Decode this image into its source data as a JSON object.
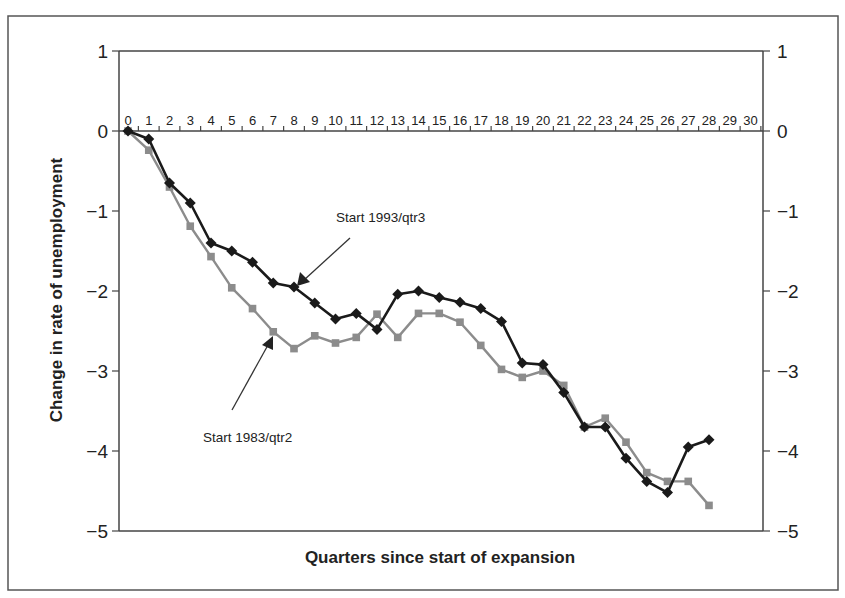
{
  "chart_data": {
    "type": "line",
    "title": "",
    "xlabel": "Quarters since start of expansion",
    "ylabel": "Change in rate of unemployment",
    "xlim": [
      0,
      30
    ],
    "ylim": [
      -5,
      1
    ],
    "x_ticks": [
      0,
      1,
      2,
      3,
      4,
      5,
      6,
      7,
      8,
      9,
      10,
      11,
      12,
      13,
      14,
      15,
      16,
      17,
      18,
      19,
      20,
      21,
      22,
      23,
      24,
      25,
      26,
      27,
      28,
      29,
      30
    ],
    "y_ticks": [
      1,
      0,
      -1,
      -2,
      -3,
      -4,
      -5
    ],
    "y_tick_labels": [
      "1",
      "0",
      "−1",
      "−2",
      "−3",
      "−4",
      "−5"
    ],
    "grid": false,
    "legend": "none (series identified by annotations)",
    "x": [
      0,
      1,
      2,
      3,
      4,
      5,
      6,
      7,
      8,
      9,
      10,
      11,
      12,
      13,
      14,
      15,
      16,
      17,
      18,
      19,
      20,
      21,
      22,
      23,
      24,
      25,
      26,
      27,
      28
    ],
    "series": [
      {
        "name": "Start 1993/qtr3",
        "color": "#1a1a1a",
        "marker": "diamond",
        "values": [
          0,
          -0.1,
          -0.65,
          -0.9,
          -1.4,
          -1.5,
          -1.64,
          -1.9,
          -1.95,
          -2.15,
          -2.35,
          -2.28,
          -2.48,
          -2.04,
          -2.0,
          -2.08,
          -2.14,
          -2.22,
          -2.38,
          -2.9,
          -2.92,
          -3.27,
          -3.7,
          -3.7,
          -4.09,
          -4.38,
          -4.52,
          -3.95,
          -3.86
        ]
      },
      {
        "name": "Start 1983/qtr2",
        "color": "#8c8c8c",
        "marker": "square",
        "values": [
          0,
          -0.24,
          -0.7,
          -1.19,
          -1.57,
          -1.96,
          -2.22,
          -2.51,
          -2.72,
          -2.56,
          -2.65,
          -2.58,
          -2.29,
          -2.58,
          -2.28,
          -2.28,
          -2.39,
          -2.68,
          -2.98,
          -3.08,
          -3.0,
          -3.18,
          -3.7,
          -3.59,
          -3.89,
          -4.27,
          -4.38,
          -4.38,
          -4.68
        ]
      }
    ],
    "annotations": [
      {
        "text": "Start 1993/qtr3",
        "series": "Start 1993/qtr3",
        "points_to_x": 8
      },
      {
        "text": "Start 1983/qtr2",
        "series": "Start 1983/qtr2",
        "points_to_x": 7
      }
    ]
  },
  "labels": {
    "xlabel": "Quarters since start of expansion",
    "ylabel": "Change in rate of unemployment",
    "annot_1993": "Start 1993/qtr3",
    "annot_1983": "Start 1983/qtr2"
  }
}
